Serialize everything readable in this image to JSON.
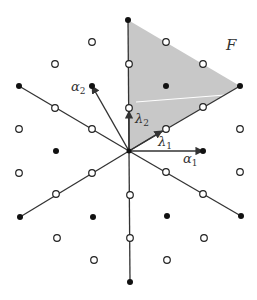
{
  "diagram": {
    "colors": {
      "region": "#c8c8c8",
      "line": "#333333",
      "point_filled": "#111111",
      "point_open_stroke": "#222222",
      "highlight_line": "#ffffff"
    },
    "labels": {
      "region": "F",
      "alpha1": "α",
      "alpha1_sub": "1",
      "alpha2": "α",
      "alpha2_sub": "2",
      "lambda1": "λ",
      "lambda1_sub": "1",
      "lambda2": "λ",
      "lambda2_sub": "2"
    },
    "origin": [
      129,
      151
    ],
    "region_vertices": [
      [
        129,
        151
      ],
      [
        128,
        20
      ],
      [
        240,
        86
      ]
    ],
    "filled_points": [
      [
        128,
        20
      ],
      [
        92,
        86
      ],
      [
        166,
        86
      ],
      [
        19,
        86
      ],
      [
        240,
        86
      ],
      [
        56,
        151
      ],
      [
        203,
        151
      ],
      [
        20,
        217
      ],
      [
        93,
        217
      ],
      [
        167,
        216
      ],
      [
        241,
        216
      ],
      [
        130,
        282
      ]
    ],
    "open_points": [
      [
        92,
        42
      ],
      [
        166,
        42
      ],
      [
        55,
        64
      ],
      [
        129,
        64
      ],
      [
        203,
        64
      ],
      [
        55,
        108
      ],
      [
        129,
        108
      ],
      [
        203,
        107
      ],
      [
        19,
        129
      ],
      [
        92,
        129
      ],
      [
        166,
        129
      ],
      [
        240,
        129
      ],
      [
        19,
        173
      ],
      [
        92,
        173
      ],
      [
        166,
        172
      ],
      [
        240,
        172
      ],
      [
        56,
        194
      ],
      [
        130,
        195
      ],
      [
        203,
        194
      ],
      [
        57,
        238
      ],
      [
        130,
        238
      ],
      [
        204,
        238
      ],
      [
        94,
        260
      ],
      [
        167,
        260
      ]
    ],
    "root_lines": [
      [
        [
          129,
          151
        ],
        [
          128,
          20
        ]
      ],
      [
        [
          129,
          151
        ],
        [
          240,
          86
        ]
      ],
      [
        [
          129,
          151
        ],
        [
          19,
          86
        ]
      ],
      [
        [
          129,
          151
        ],
        [
          20,
          217
        ]
      ],
      [
        [
          129,
          151
        ],
        [
          241,
          216
        ]
      ],
      [
        [
          129,
          151
        ],
        [
          130,
          282
        ]
      ]
    ],
    "arrows": [
      {
        "name": "alpha1",
        "from": [
          129,
          151
        ],
        "to": [
          203,
          151
        ]
      },
      {
        "name": "alpha2",
        "from": [
          129,
          151
        ],
        "to": [
          92,
          86
        ]
      },
      {
        "name": "lambda1",
        "from": [
          129,
          151
        ],
        "to": [
          162,
          131
        ]
      },
      {
        "name": "lambda2",
        "from": [
          129,
          151
        ],
        "to": [
          129,
          111
        ]
      }
    ]
  }
}
